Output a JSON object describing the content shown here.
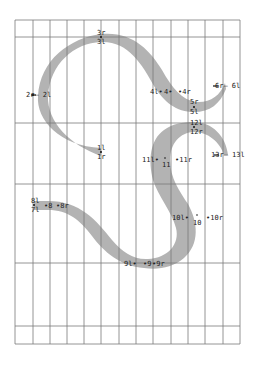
{
  "diagram": {
    "type": "glyph-outline-grid",
    "colors": {
      "background": "#ffffff",
      "grid": "#7a7a7a",
      "stroke_fill": "#b3b3b3",
      "label": "#222222"
    },
    "grid": {
      "x_lines": [
        15,
        33,
        50,
        67,
        84,
        101,
        119,
        136,
        153,
        171,
        188,
        205,
        223,
        240
      ],
      "y_lines": [
        20,
        37,
        123,
        184,
        263,
        326,
        344
      ]
    },
    "points": [
      {
        "id": "1",
        "labels": [
          "1l",
          "1r"
        ],
        "x": 101,
        "y": 152
      },
      {
        "id": "2",
        "labels": [
          "2r",
          "2l"
        ],
        "x": 33,
        "y": 95
      },
      {
        "id": "3",
        "labels": [
          "3r",
          "3l"
        ],
        "x": 101,
        "y": 37
      },
      {
        "id": "4",
        "labels": [
          "4l",
          "4",
          "4r"
        ],
        "x": 166,
        "y": 92
      },
      {
        "id": "5",
        "labels": [
          "5r",
          "5l"
        ],
        "x": 194,
        "y": 107
      },
      {
        "id": "6",
        "labels": [
          "6r",
          "6l"
        ],
        "x": 225,
        "y": 86
      },
      {
        "id": "7",
        "labels": [
          "7l"
        ],
        "x": 34,
        "y": 207
      },
      {
        "id": "8",
        "labels": [
          "8l",
          "8",
          "8r"
        ],
        "x": 48,
        "y": 205
      },
      {
        "id": "9",
        "labels": [
          "9l",
          "9",
          "9r"
        ],
        "x": 147,
        "y": 263
      },
      {
        "id": "10",
        "labels": [
          "10l",
          "10",
          "10r"
        ],
        "x": 197,
        "y": 218
      },
      {
        "id": "11",
        "labels": [
          "11l",
          "11",
          "11r"
        ],
        "x": 165,
        "y": 161
      },
      {
        "id": "12",
        "labels": [
          "12l",
          "12r"
        ],
        "x": 194,
        "y": 127
      },
      {
        "id": "13",
        "labels": [
          "13r",
          "13l"
        ],
        "x": 226,
        "y": 155
      }
    ],
    "text_labels": {
      "l3r": "3r",
      "l3l": "3l",
      "l2": "2r— 2l",
      "l41": "4l•",
      "l4": "4•",
      "l4r": "•4r",
      "l5r": "5r",
      "l5l": "5l",
      "l6": "6r— 6l",
      "l12l": "12l",
      "l12r": "12r",
      "l1l": "1l",
      "l1r": "1r",
      "l11l": "11l•",
      "l11": "11",
      "l11r": "•11r",
      "l13": "13r— 13l",
      "l8l": "8l",
      "l7l": "7l",
      "l8": "•8",
      "l8r": "•8r",
      "l10l": "10l•",
      "l10": "10",
      "l10r": "•10r",
      "l9l": "9l•",
      "l9": "•9",
      "l9r": "•9r"
    }
  }
}
